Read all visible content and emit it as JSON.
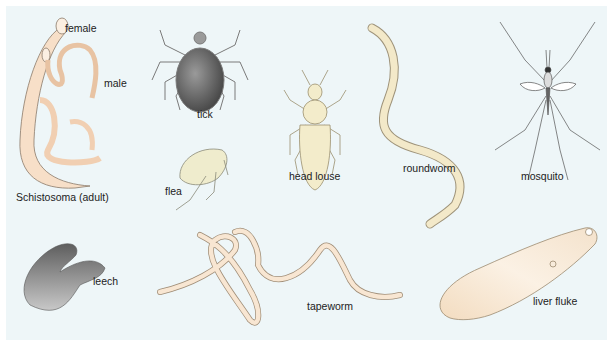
{
  "figure": {
    "background_color": "#eef6f8",
    "organisms": [
      {
        "id": "schistosoma",
        "label": "Schistosoma (adult)",
        "sub_labels": [
          "female",
          "male"
        ],
        "color": "#f6dcc4"
      },
      {
        "id": "tick",
        "label": "tick",
        "color": "#6b6b6b"
      },
      {
        "id": "flea",
        "label": "flea",
        "color": "#eeeac8"
      },
      {
        "id": "head-louse",
        "label": "head louse",
        "color": "#f3eccb"
      },
      {
        "id": "roundworm",
        "label": "roundworm",
        "color": "#f3e9c9"
      },
      {
        "id": "mosquito",
        "label": "mosquito",
        "color": "#888888"
      },
      {
        "id": "leech",
        "label": "leech",
        "color": "#7a7a7a"
      },
      {
        "id": "tapeworm",
        "label": "tapeworm",
        "color": "#f6dcc0"
      },
      {
        "id": "liver-fluke",
        "label": "liver fluke",
        "color": "#f6e6cf"
      }
    ]
  },
  "labels": {
    "female": "female",
    "male": "male",
    "schistosoma": "Schistosoma (adult)",
    "tick": "tick",
    "flea": "flea",
    "head_louse": "head louse",
    "roundworm": "roundworm",
    "mosquito": "mosquito",
    "leech": "leech",
    "tapeworm": "tapeworm",
    "liver_fluke": "liver fluke"
  }
}
